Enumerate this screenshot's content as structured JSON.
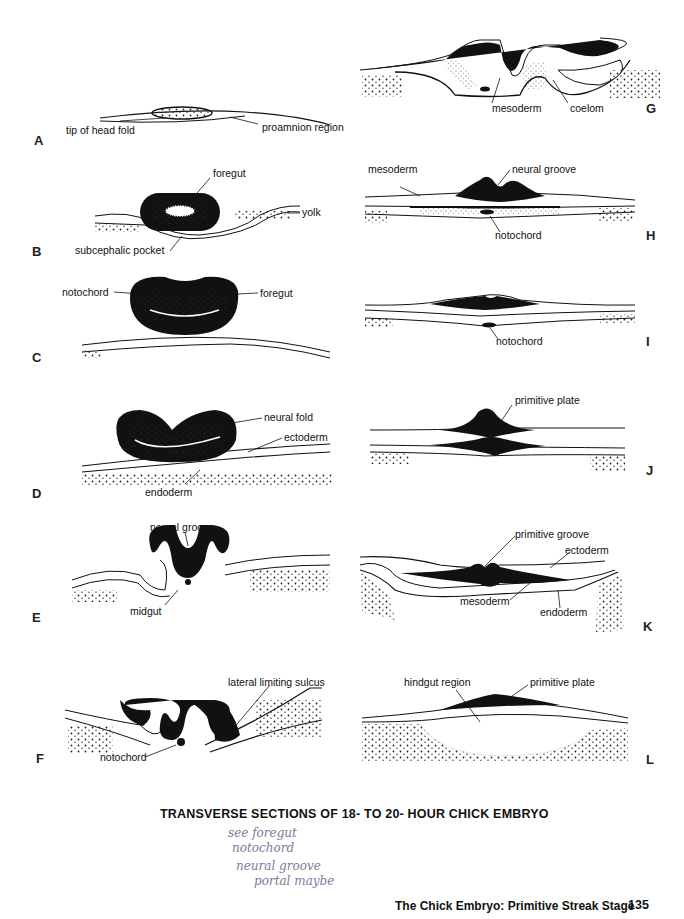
{
  "page": {
    "caption": "TRANSVERSE SECTIONS OF 18- TO 20- HOUR CHICK EMBRYO",
    "footer_title": "The Chick Embryo: Primitive Streak Stage",
    "page_number": "135",
    "handwritten_notes": [
      "see foregut",
      "notochord",
      "neural groove",
      "portal maybe"
    ]
  },
  "figures": {
    "A": {
      "letter": "A",
      "labels": [
        "tip of head fold",
        "proamnion region"
      ]
    },
    "B": {
      "letter": "B",
      "labels": [
        "foregut",
        "yolk",
        "subcephalic pocket"
      ]
    },
    "C": {
      "letter": "C",
      "labels": [
        "notochord",
        "foregut"
      ]
    },
    "D": {
      "letter": "D",
      "labels": [
        "neural fold",
        "ectoderm",
        "endoderm"
      ]
    },
    "E": {
      "letter": "E",
      "labels": [
        "neural groove",
        "midgut"
      ]
    },
    "F": {
      "letter": "F",
      "labels": [
        "lateral limiting sulcus",
        "notochord"
      ]
    },
    "G": {
      "letter": "G",
      "labels": [
        "mesoderm",
        "coelom"
      ]
    },
    "H": {
      "letter": "H",
      "labels": [
        "mesoderm",
        "neural groove",
        "notochord"
      ]
    },
    "I": {
      "letter": "I",
      "labels": [
        "notochord"
      ]
    },
    "J": {
      "letter": "J",
      "labels": [
        "primitive plate"
      ]
    },
    "K": {
      "letter": "K",
      "labels": [
        "primitive groove",
        "ectoderm",
        "mesoderm",
        "endoderm"
      ]
    },
    "L": {
      "letter": "L",
      "labels": [
        "hindgut region",
        "primitive plate"
      ]
    }
  }
}
